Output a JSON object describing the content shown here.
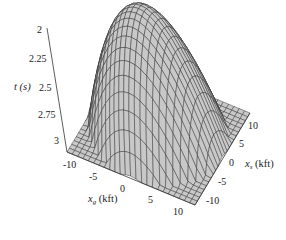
{
  "chart_data": {
    "type": "surface3d",
    "title": "",
    "zlabel": "t (s)",
    "xlabel": "x_g (kft)",
    "ylabel": "x_s (kft)",
    "z_ticks": [
      "2",
      "2.25",
      "2.5",
      "2.75",
      "3"
    ],
    "x_ticks": [
      "-10",
      "-5",
      "0",
      "5",
      "10"
    ],
    "y_ticks": [
      "-10",
      "-5",
      "0",
      "5",
      "10"
    ],
    "zlim": [
      3,
      2
    ],
    "z_axis_inverted": true,
    "xlim": [
      -10,
      10
    ],
    "ylim": [
      -10,
      10
    ],
    "surface": {
      "description": "Traveltime surface t(x_s, x_g); peak (min t ≈ 2.0 s) near x_s = x_g = 0, falling to ≈ 3 s at far offsets",
      "peak_t": 2.0,
      "edge_t_approx": 3.0,
      "mesh_lines": 24,
      "fill_color": "#c8c8c8",
      "line_color": "#2a2a2a"
    },
    "grid": false,
    "legend": null
  },
  "labels": {
    "z_title": "t (s)",
    "x_title_main": "x",
    "x_title_sub": "g",
    "x_title_unit": " (kft)",
    "y_title_main": "x",
    "y_title_sub": "s",
    "y_title_unit": " (kft)"
  }
}
